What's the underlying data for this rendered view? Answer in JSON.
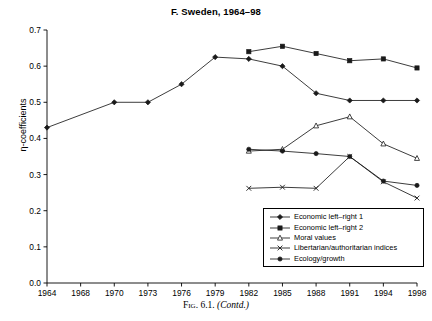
{
  "figure": {
    "caption_prefix": "Fig. 6.1.",
    "caption_suffix": "(Contd.)"
  },
  "chart_data": {
    "type": "line",
    "title": "F. Sweden, 1964–98",
    "xlabel": "",
    "ylabel": "η-coefficients",
    "categories": [
      "1964",
      "1968",
      "1970",
      "1973",
      "1976",
      "1979",
      "1982",
      "1985",
      "1988",
      "1991",
      "1994",
      "1998"
    ],
    "ylim": [
      0.0,
      0.7
    ],
    "ytick_labels": [
      "0.0",
      "0.1",
      "0.2",
      "0.3",
      "0.4",
      "0.5",
      "0.6",
      "0.7"
    ],
    "ytick_values": [
      0.0,
      0.1,
      0.2,
      0.3,
      0.4,
      0.5,
      0.6,
      0.7
    ],
    "grid": false,
    "legend_position": "bottom-right",
    "series": [
      {
        "name": "Economic left–right 1",
        "marker": "diamond",
        "x": [
          "1964",
          "1970",
          "1973",
          "1976",
          "1979",
          "1982",
          "1985",
          "1988",
          "1991",
          "1994",
          "1998"
        ],
        "values": [
          0.43,
          0.5,
          0.5,
          0.55,
          0.625,
          0.62,
          0.6,
          0.525,
          0.505,
          0.505,
          0.505
        ]
      },
      {
        "name": "Economic left–right 2",
        "marker": "square",
        "x": [
          "1982",
          "1985",
          "1988",
          "1991",
          "1994",
          "1998"
        ],
        "values": [
          0.64,
          0.655,
          0.635,
          0.615,
          0.62,
          0.595
        ]
      },
      {
        "name": "Moral values",
        "marker": "triangle",
        "x": [
          "1982",
          "1985",
          "1988",
          "1991",
          "1994",
          "1998"
        ],
        "values": [
          0.365,
          0.37,
          0.435,
          0.46,
          0.385,
          0.345
        ]
      },
      {
        "name": "Libertarian/authoritarian indices",
        "marker": "x",
        "x": [
          "1982",
          "1985",
          "1988",
          "1991",
          "1994",
          "1998"
        ],
        "values": [
          0.262,
          0.265,
          0.262,
          0.35,
          0.28,
          0.235
        ]
      },
      {
        "name": "Ecology/growth",
        "marker": "dot",
        "x": [
          "1982",
          "1985",
          "1988",
          "1991",
          "1994",
          "1998"
        ],
        "values": [
          0.37,
          0.365,
          0.358,
          0.35,
          0.282,
          0.27
        ]
      }
    ]
  }
}
